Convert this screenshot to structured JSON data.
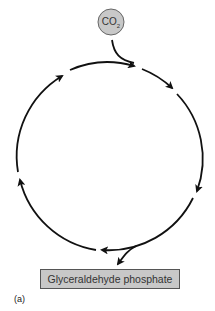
{
  "diagram": {
    "type": "cycle",
    "input": {
      "label": "CO",
      "subscript": "2",
      "shape": "circle",
      "fill": "#c8c8c8",
      "stroke": "#666666"
    },
    "output": {
      "label": "Glyceraldehyde phosphate",
      "shape": "rectangle",
      "fill": "#c8c8c8",
      "stroke": "#555555"
    },
    "panel_label": "(a)",
    "cycle": {
      "direction": "clockwise",
      "segments": 6,
      "stroke": "#111111"
    }
  }
}
